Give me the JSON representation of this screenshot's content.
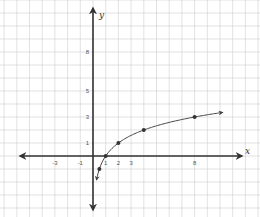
{
  "chart_data": {
    "type": "line",
    "title": "",
    "function": "y = log2(x)",
    "xlabel": "x",
    "ylabel": "y",
    "x_tick_labels": [
      "-3",
      "-1",
      "1",
      "2",
      "3",
      "8"
    ],
    "y_tick_labels": [
      "1",
      "3",
      "5",
      "8"
    ],
    "points": [
      {
        "x": 0.5,
        "y": -1
      },
      {
        "x": 1,
        "y": 0
      },
      {
        "x": 2,
        "y": 1
      },
      {
        "x": 4,
        "y": 2
      },
      {
        "x": 8,
        "y": 3
      }
    ],
    "curve_arrows": [
      "lower end toward y negative infinity near x=0",
      "upper end toward increasing x"
    ],
    "xlim": [
      -6,
      12
    ],
    "ylim": [
      -4,
      11
    ],
    "grid": true,
    "legend": null
  },
  "colors": {
    "grid": "#cfcfcf",
    "axis": "#333333",
    "curve": "#444444",
    "point": "#333333",
    "background": "#ffffff"
  },
  "layout": {
    "origin_px": [
      93,
      156
    ],
    "unit_x_px": 12.7,
    "unit_y_px": 13
  }
}
